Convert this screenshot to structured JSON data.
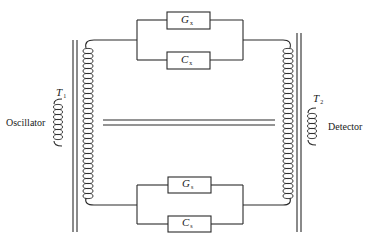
{
  "diagram": {
    "type": "ac-bridge-circuit",
    "colors": {
      "line": "#2a2a2a",
      "background": "#ffffff"
    },
    "transformers": [
      {
        "id": "T1",
        "symbol": "T",
        "subscript": "1",
        "connected_to": "Oscillator"
      },
      {
        "id": "T2",
        "symbol": "T",
        "subscript": "2",
        "connected_to": "Detector"
      }
    ],
    "labels": {
      "oscillator": "Oscillator",
      "detector": "Detector"
    },
    "components": {
      "top": [
        {
          "id": "Gx",
          "symbol": "G",
          "subscript": "x"
        },
        {
          "id": "Cx",
          "symbol": "C",
          "subscript": "x"
        }
      ],
      "bottom": [
        {
          "id": "Gs",
          "symbol": "G",
          "subscript": "s"
        },
        {
          "id": "Cs",
          "symbol": "C",
          "subscript": "s"
        }
      ]
    }
  }
}
